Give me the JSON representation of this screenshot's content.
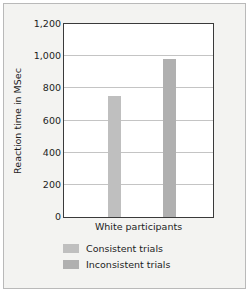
{
  "chart_data": {
    "type": "bar",
    "title": "",
    "xlabel": "",
    "ylabel": "Reaction time in MSec",
    "categories": [
      "White participants"
    ],
    "series": [
      {
        "name": "Consistent trials",
        "values": [
          750
        ],
        "color": "#bfbfbf"
      },
      {
        "name": "Inconsistent trials",
        "values": [
          980
        ],
        "color": "#b0b0b0"
      }
    ],
    "ylim": [
      0,
      1200
    ],
    "ytick_values": [
      0,
      200,
      400,
      600,
      800,
      1000,
      1200
    ],
    "ytick_labels": [
      "0",
      "200",
      "400",
      "600",
      "800",
      "1,000",
      "1,200"
    ],
    "grid": "horizontal",
    "legend_position": "bottom-left"
  },
  "style": {
    "outer_border_color": "#b9b9b9",
    "figure_background": "#f3f3f1",
    "plot_background": "#ffffff",
    "plot_border_color": "#3a3a3a",
    "gridline_color": "#c4c4c4",
    "text_color": "#1d1d1d"
  }
}
